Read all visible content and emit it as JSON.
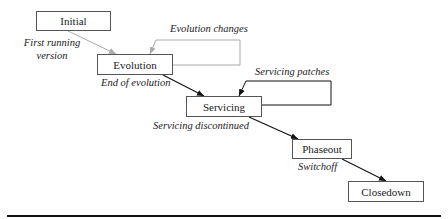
{
  "diagram": {
    "stages": [
      {
        "id": "initial",
        "label": "Initial"
      },
      {
        "id": "evolution",
        "label": "Evolution"
      },
      {
        "id": "servicing",
        "label": "Servicing"
      },
      {
        "id": "phaseout",
        "label": "Phaseout"
      },
      {
        "id": "closedown",
        "label": "Closedown"
      }
    ],
    "transitions": [
      {
        "from": "initial",
        "to": "evolution",
        "label_line1": "First running",
        "label_line2": "version",
        "color": "#aaaaaa"
      },
      {
        "from": "evolution",
        "to": "servicing",
        "label": "End of evolution",
        "color": "#111111"
      },
      {
        "from": "servicing",
        "to": "phaseout",
        "label": "Servicing discontinued",
        "color": "#111111"
      },
      {
        "from": "phaseout",
        "to": "closedown",
        "label": "Switchoff",
        "color": "#111111"
      }
    ],
    "loops": [
      {
        "stage": "evolution",
        "label": "Evolution changes",
        "color": "#aaaaaa"
      },
      {
        "stage": "servicing",
        "label": "Servicing patches",
        "color": "#111111"
      }
    ]
  }
}
